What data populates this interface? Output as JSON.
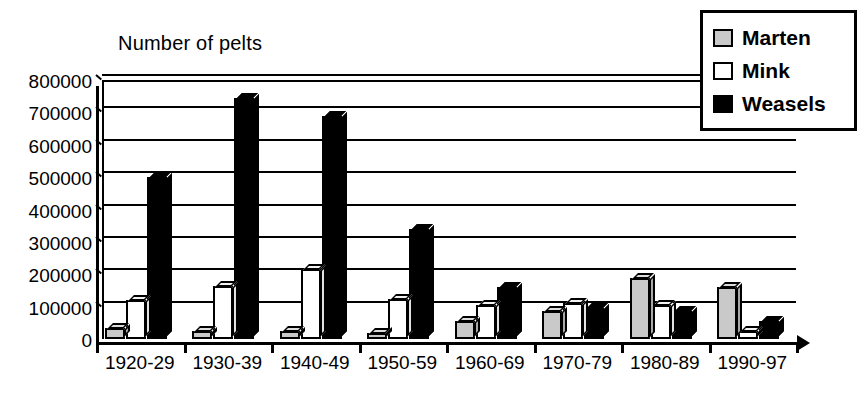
{
  "chart_data": {
    "type": "bar",
    "title": "Number of pelts",
    "xlabel": "",
    "ylabel": "",
    "ylim": [
      0,
      800000
    ],
    "ytick_step": 100000,
    "yticks": [
      0,
      100000,
      200000,
      300000,
      400000,
      500000,
      600000,
      700000,
      800000
    ],
    "ytick_labels": [
      "0",
      "100000",
      "200000",
      "300000",
      "400000",
      "500000",
      "600000",
      "700000",
      "800000"
    ],
    "grid": true,
    "legend_position": "top-right",
    "categories": [
      "1920-29",
      "1930-39",
      "1940-49",
      "1950-59",
      "1960-69",
      "1970-79",
      "1980-89",
      "1990-97"
    ],
    "series": [
      {
        "name": "Marten",
        "color": "#c9c9c9",
        "values": [
          35000,
          25000,
          25000,
          20000,
          55000,
          85000,
          190000,
          160000
        ]
      },
      {
        "name": "Mink",
        "color": "#ffffff",
        "values": [
          120000,
          165000,
          215000,
          125000,
          105000,
          110000,
          105000,
          25000
        ]
      },
      {
        "name": "Weasels",
        "color": "#000000",
        "values": [
          500000,
          745000,
          690000,
          340000,
          160000,
          95000,
          85000,
          55000
        ]
      }
    ]
  },
  "legend": {
    "items": [
      {
        "label": "Marten",
        "swatch": "gray-swatch-icon"
      },
      {
        "label": "Mink",
        "swatch": "white-swatch-icon"
      },
      {
        "label": "Weasels",
        "swatch": "black-swatch-icon"
      }
    ]
  }
}
